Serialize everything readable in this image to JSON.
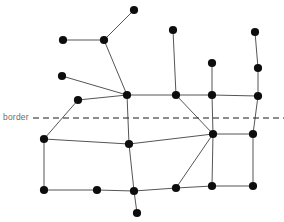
{
  "figure": {
    "type": "node-link-diagram",
    "width": 284,
    "height": 222,
    "background": "#ffffff"
  },
  "annotations": {
    "border_label": "border",
    "border_label_color": "#6b6b6b",
    "border_label_x": 3,
    "border_label_y": 112
  },
  "border_line": {
    "name": "border-dashed-line",
    "y": 118,
    "x_start": 33,
    "x_end": 284,
    "color": "#1a1a1a",
    "width": 1,
    "dash": "6 4"
  },
  "style": {
    "node_color": "#0d0d0d",
    "node_radius": 4.1,
    "edge_color": "#555555",
    "edge_width": 1
  },
  "chart_data": {
    "type": "scatter",
    "title": "",
    "xlabel": "",
    "ylabel": "",
    "nodes": [
      {
        "id": "n1",
        "x": 134,
        "y": 10
      },
      {
        "id": "n2",
        "x": 63,
        "y": 40
      },
      {
        "id": "n3",
        "x": 104,
        "y": 40
      },
      {
        "id": "n4",
        "x": 173,
        "y": 30
      },
      {
        "id": "n5",
        "x": 255,
        "y": 32
      },
      {
        "id": "n6",
        "x": 62,
        "y": 76
      },
      {
        "id": "n7",
        "x": 212,
        "y": 63
      },
      {
        "id": "n8",
        "x": 258,
        "y": 68
      },
      {
        "id": "n9",
        "x": 78,
        "y": 100
      },
      {
        "id": "n10",
        "x": 127,
        "y": 95
      },
      {
        "id": "n11",
        "x": 176,
        "y": 95
      },
      {
        "id": "n12",
        "x": 212,
        "y": 95
      },
      {
        "id": "n13",
        "x": 258,
        "y": 96
      },
      {
        "id": "n14",
        "x": 44,
        "y": 139
      },
      {
        "id": "n15",
        "x": 129,
        "y": 144
      },
      {
        "id": "n16",
        "x": 213,
        "y": 134
      },
      {
        "id": "n17",
        "x": 253,
        "y": 134
      },
      {
        "id": "n18",
        "x": 44,
        "y": 190
      },
      {
        "id": "n19",
        "x": 97,
        "y": 190
      },
      {
        "id": "n20",
        "x": 134,
        "y": 191
      },
      {
        "id": "n21",
        "x": 176,
        "y": 188
      },
      {
        "id": "n22",
        "x": 212,
        "y": 186
      },
      {
        "id": "n23",
        "x": 253,
        "y": 186
      },
      {
        "id": "n24",
        "x": 137,
        "y": 213
      }
    ],
    "edges": [
      [
        "n2",
        "n3"
      ],
      [
        "n3",
        "n1"
      ],
      [
        "n3",
        "n10"
      ],
      [
        "n6",
        "n10"
      ],
      [
        "n9",
        "n10"
      ],
      [
        "n9",
        "n14"
      ],
      [
        "n10",
        "n11"
      ],
      [
        "n10",
        "n15"
      ],
      [
        "n11",
        "n4"
      ],
      [
        "n11",
        "n12"
      ],
      [
        "n11",
        "n16"
      ],
      [
        "n12",
        "n7"
      ],
      [
        "n12",
        "n13"
      ],
      [
        "n12",
        "n16"
      ],
      [
        "n13",
        "n8"
      ],
      [
        "n8",
        "n5"
      ],
      [
        "n13",
        "n17"
      ],
      [
        "n14",
        "n15"
      ],
      [
        "n14",
        "n18"
      ],
      [
        "n15",
        "n16"
      ],
      [
        "n15",
        "n20"
      ],
      [
        "n16",
        "n17"
      ],
      [
        "n16",
        "n21"
      ],
      [
        "n16",
        "n22"
      ],
      [
        "n17",
        "n23"
      ],
      [
        "n18",
        "n19"
      ],
      [
        "n19",
        "n20"
      ],
      [
        "n20",
        "n21"
      ],
      [
        "n20",
        "n24"
      ],
      [
        "n21",
        "n22"
      ],
      [
        "n22",
        "n23"
      ]
    ]
  }
}
